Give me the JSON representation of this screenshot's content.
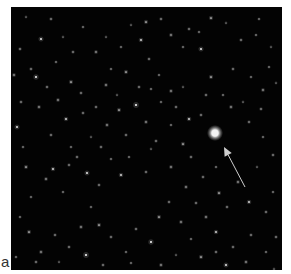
{
  "figure": {
    "panel_label": "a",
    "image": {
      "description": "Astronomical star field photograph with an arrow pointing to a bright object",
      "background_color": "#030303",
      "target_object": {
        "x": 204,
        "y": 126,
        "radius": 4.5,
        "color": "#f4f4f4"
      },
      "arrow": {
        "tip_x": 213,
        "tip_y": 140,
        "tail_x": 234,
        "tail_y": 180,
        "color": "#cfcfcf"
      },
      "stars": [
        [
          30,
          32,
          1.4
        ],
        [
          40,
          12,
          1.0
        ],
        [
          52,
          30,
          0.8
        ],
        [
          72,
          20,
          0.9
        ],
        [
          85,
          45,
          1.1
        ],
        [
          100,
          62,
          0.9
        ],
        [
          120,
          18,
          0.8
        ],
        [
          135,
          15,
          1.2
        ],
        [
          130,
          33,
          1.3
        ],
        [
          150,
          12,
          1.0
        ],
        [
          160,
          28,
          1.1
        ],
        [
          172,
          40,
          0.9
        ],
        [
          178,
          22,
          1.0
        ],
        [
          188,
          25,
          0.9
        ],
        [
          200,
          11,
          1.2
        ],
        [
          215,
          16,
          0.8
        ],
        [
          230,
          33,
          1.0
        ],
        [
          245,
          28,
          0.9
        ],
        [
          260,
          40,
          0.8
        ],
        [
          190,
          42,
          1.4
        ],
        [
          9,
          42,
          1.0
        ],
        [
          20,
          62,
          1.0
        ],
        [
          45,
          55,
          0.9
        ],
        [
          60,
          75,
          1.2
        ],
        [
          25,
          70,
          1.5
        ],
        [
          36,
          80,
          1.0
        ],
        [
          3,
          68,
          1.1
        ],
        [
          70,
          86,
          1.0
        ],
        [
          95,
          78,
          1.1
        ],
        [
          115,
          65,
          1.2
        ],
        [
          138,
          52,
          1.0
        ],
        [
          148,
          68,
          0.9
        ],
        [
          160,
          84,
          1.1
        ],
        [
          172,
          80,
          0.8
        ],
        [
          200,
          70,
          1.2
        ],
        [
          222,
          62,
          1.0
        ],
        [
          240,
          70,
          0.9
        ],
        [
          258,
          60,
          0.9
        ],
        [
          252,
          83,
          1.1
        ],
        [
          265,
          76,
          0.8
        ],
        [
          6,
          120,
          1.4
        ],
        [
          12,
          140,
          0.9
        ],
        [
          28,
          100,
          1.1
        ],
        [
          40,
          128,
          1.0
        ],
        [
          55,
          112,
          1.3
        ],
        [
          47,
          93,
          1.1
        ],
        [
          60,
          140,
          0.9
        ],
        [
          72,
          106,
          1.0
        ],
        [
          80,
          130,
          0.8
        ],
        [
          66,
          150,
          1.0
        ],
        [
          15,
          160,
          1.2
        ],
        [
          35,
          172,
          1.1
        ],
        [
          52,
          185,
          0.9
        ],
        [
          42,
          162,
          1.3
        ],
        [
          20,
          190,
          0.9
        ],
        [
          58,
          158,
          1.0
        ],
        [
          76,
          166,
          1.4
        ],
        [
          88,
          178,
          1.0
        ],
        [
          108,
          103,
          1.2
        ],
        [
          125,
          98,
          1.6
        ],
        [
          115,
          128,
          1.0
        ],
        [
          135,
          115,
          1.1
        ],
        [
          145,
          134,
          1.0
        ],
        [
          160,
          118,
          0.9
        ],
        [
          172,
          137,
          1.2
        ],
        [
          180,
          150,
          1.0
        ],
        [
          160,
          160,
          1.1
        ],
        [
          135,
          165,
          1.0
        ],
        [
          110,
          168,
          1.3
        ],
        [
          100,
          152,
          0.9
        ],
        [
          90,
          140,
          1.0
        ],
        [
          118,
          150,
          0.9
        ],
        [
          140,
          142,
          0.8
        ],
        [
          190,
          108,
          1.0
        ],
        [
          238,
          115,
          1.0
        ],
        [
          252,
          130,
          0.9
        ],
        [
          262,
          148,
          1.0
        ],
        [
          246,
          160,
          0.8
        ],
        [
          227,
          175,
          1.1
        ],
        [
          238,
          195,
          1.3
        ],
        [
          255,
          205,
          1.0
        ],
        [
          262,
          185,
          0.9
        ],
        [
          208,
          186,
          1.2
        ],
        [
          216,
          200,
          1.0
        ],
        [
          195,
          210,
          1.1
        ],
        [
          205,
          225,
          1.3
        ],
        [
          222,
          240,
          1.0
        ],
        [
          240,
          228,
          1.0
        ],
        [
          255,
          245,
          0.9
        ],
        [
          235,
          255,
          1.1
        ],
        [
          215,
          258,
          1.4
        ],
        [
          205,
          245,
          1.0
        ],
        [
          190,
          250,
          1.2
        ],
        [
          180,
          232,
          0.9
        ],
        [
          170,
          215,
          1.1
        ],
        [
          158,
          195,
          1.0
        ],
        [
          148,
          210,
          1.2
        ],
        [
          140,
          235,
          1.5
        ],
        [
          125,
          222,
          1.0
        ],
        [
          115,
          245,
          0.9
        ],
        [
          100,
          230,
          1.0
        ],
        [
          88,
          218,
          1.2
        ],
        [
          80,
          200,
          0.9
        ],
        [
          70,
          220,
          1.1
        ],
        [
          58,
          240,
          1.0
        ],
        [
          44,
          228,
          1.0
        ],
        [
          30,
          245,
          1.1
        ],
        [
          18,
          225,
          1.2
        ],
        [
          9,
          210,
          0.9
        ],
        [
          25,
          255,
          1.0
        ],
        [
          48,
          255,
          0.8
        ],
        [
          75,
          248,
          1.6
        ],
        [
          92,
          258,
          1.0
        ],
        [
          120,
          256,
          0.9
        ],
        [
          150,
          258,
          1.1
        ],
        [
          165,
          248,
          0.8
        ],
        [
          185,
          196,
          1.0
        ],
        [
          175,
          180,
          1.1
        ],
        [
          192,
          170,
          1.0
        ],
        [
          205,
          160,
          0.9
        ],
        [
          85,
          100,
          1.0
        ],
        [
          96,
          118,
          1.1
        ],
        [
          150,
          95,
          0.9
        ],
        [
          165,
          100,
          1.0
        ],
        [
          178,
          112,
          1.3
        ],
        [
          128,
          80,
          1.0
        ],
        [
          140,
          82,
          0.9
        ],
        [
          106,
          88,
          0.8
        ],
        [
          250,
          102,
          1.0
        ],
        [
          232,
          95,
          0.8
        ],
        [
          220,
          100,
          1.1
        ],
        [
          212,
          88,
          0.9
        ],
        [
          195,
          88,
          1.0
        ],
        [
          10,
          95,
          1.0
        ],
        [
          5,
          250,
          0.9
        ],
        [
          265,
          230,
          1.0
        ],
        [
          263,
          262,
          0.8
        ],
        [
          110,
          40,
          0.9
        ],
        [
          95,
          30,
          0.8
        ],
        [
          62,
          45,
          1.0
        ],
        [
          15,
          10,
          0.8
        ],
        [
          248,
          12,
          0.9
        ]
      ]
    }
  }
}
